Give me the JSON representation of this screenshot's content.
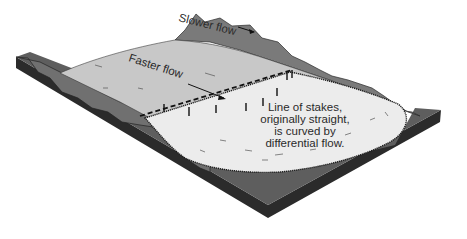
{
  "diagram": {
    "labels": {
      "slower_flow": "Slower flow",
      "faster_flow": "Faster flow",
      "caption_line1": "Line of stakes,",
      "caption_line2": "originally straight,",
      "caption_line3": "is curved by",
      "caption_line4": "differential flow."
    },
    "elements": [
      "base-slab",
      "left-valley-wall",
      "right-mountain-ridge",
      "glacier-body",
      "glacier-snout",
      "original-stake-line",
      "stakes",
      "slower-flow-arrow",
      "faster-flow-arrow"
    ],
    "colors": {
      "slab_top": "#5e5e5e",
      "slab_front": "#2b2b2b",
      "mountain": "#7a7a7a",
      "mountain_dark": "#555555",
      "glacier": "#c8c8c8",
      "snout": "#ececec",
      "ink": "#1e1e1e",
      "background": "#ffffff"
    }
  }
}
